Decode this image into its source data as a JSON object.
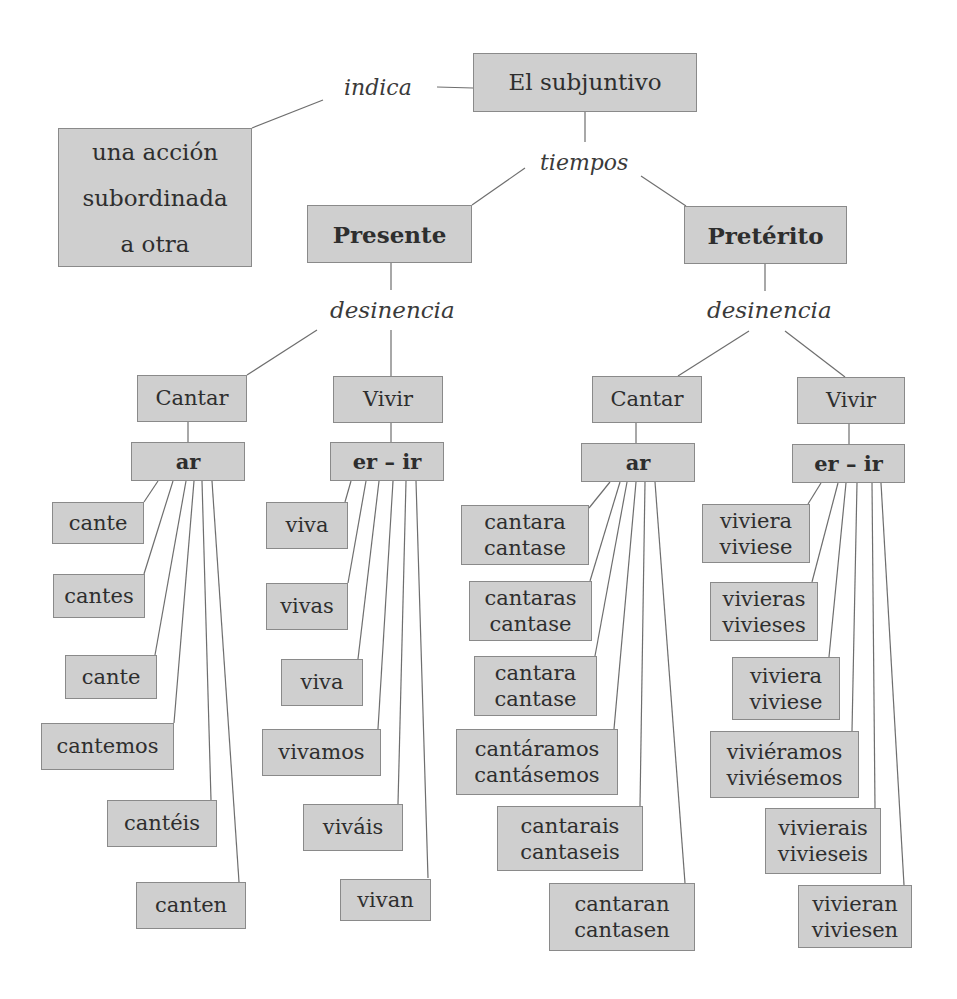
{
  "root": {
    "title": "El subjuntivo"
  },
  "indica": {
    "label": "indica",
    "target": [
      "una acción",
      "subordinada",
      "a otra"
    ]
  },
  "tiempos": {
    "label": "tiempos"
  },
  "presente": {
    "title": "Presente",
    "connector": "desinencia",
    "cantar": {
      "verb": "Cantar",
      "ending": "ar",
      "forms": [
        "cante",
        "cantes",
        "cante",
        "cantemos",
        "cantéis",
        "canten"
      ]
    },
    "vivir": {
      "verb": "Vivir",
      "ending": "er – ir",
      "forms": [
        "viva",
        "vivas",
        "viva",
        "vivamos",
        "viváis",
        "vivan"
      ]
    }
  },
  "preterito": {
    "title": "Pretérito",
    "connector": "desinencia",
    "cantar": {
      "verb": "Cantar",
      "ending": "ar",
      "forms": [
        [
          "cantara",
          "cantase"
        ],
        [
          "cantaras",
          "cantase"
        ],
        [
          "cantara",
          "cantase"
        ],
        [
          "cantáramos",
          "cantásemos"
        ],
        [
          "cantarais",
          "cantaseis"
        ],
        [
          "cantaran",
          "cantasen"
        ]
      ]
    },
    "vivir": {
      "verb": "Vivir",
      "ending": "er – ir",
      "forms": [
        [
          "viviera",
          "viviese"
        ],
        [
          "vivieras",
          "vivieses"
        ],
        [
          "viviera",
          "viviese"
        ],
        [
          "viviéramos",
          "viviésemos"
        ],
        [
          "vivierais",
          "vivieseis"
        ],
        [
          "vivieran",
          "viviesen"
        ]
      ]
    }
  },
  "colors": {
    "box_fill": "#cfcfcf",
    "box_border": "#8a8a8a",
    "line": "#6e6e6e",
    "text": "#2e2e2e"
  }
}
